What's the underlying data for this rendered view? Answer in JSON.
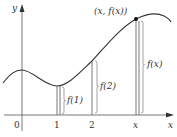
{
  "diagram": {
    "axes": {
      "x_label": "x",
      "y_label": "y",
      "origin_label": "0"
    },
    "ticks": [
      {
        "label": "1"
      },
      {
        "label": "2"
      },
      {
        "label": "x"
      }
    ],
    "point_label": "(x, f(x))",
    "segments": [
      {
        "label": "f(1)"
      },
      {
        "label": "f(2)"
      },
      {
        "label": "f(x)"
      }
    ],
    "colors": {
      "stroke": "#333333",
      "segment": "#555555"
    }
  }
}
